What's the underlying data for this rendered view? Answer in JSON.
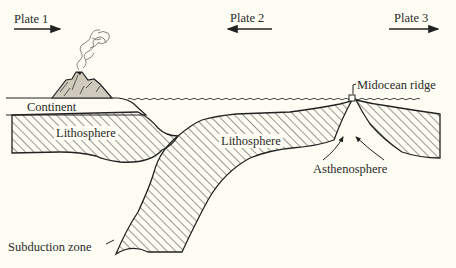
{
  "diagram": {
    "plates": [
      {
        "label": "Plate 1",
        "direction": "right"
      },
      {
        "label": "Plate 2",
        "direction": "left"
      },
      {
        "label": "Plate 3",
        "direction": "right"
      }
    ],
    "labels": {
      "continent": "Continent",
      "lithosphere_left": "Lithosphere",
      "lithosphere_center": "Lithosphere",
      "midocean_ridge": "Midocean ridge",
      "asthenosphere": "Asthenosphere",
      "subduction_zone": "Subduction zone"
    },
    "features": [
      "volcano-with-plume",
      "ocean-surface",
      "hatched-lithosphere"
    ],
    "colors": {
      "background": "#fefdf3",
      "ink": "#2a2a2a"
    }
  }
}
